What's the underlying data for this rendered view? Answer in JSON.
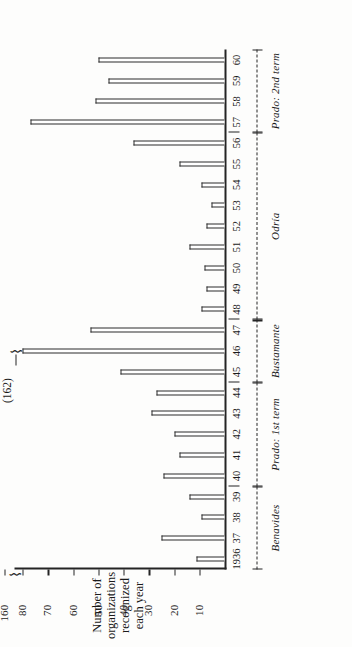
{
  "figure": {
    "orientation": "rotated-90-ccw",
    "y_axis_title": "Number of\norganizations\nrecognized\neach year",
    "out_of_range_note": "(162)",
    "axis_break_glyph": "⌇"
  },
  "chart_data": {
    "type": "bar",
    "title": "",
    "subtitle": "",
    "xlabel": "",
    "ylabel": "Number of organizations recognized each year",
    "ylim": [
      0,
      80
    ],
    "y_break_above": 80,
    "ytick_labels": [
      "10",
      "20",
      "30",
      "40",
      "50",
      "60",
      "70",
      "80",
      "160"
    ],
    "ytick_values": [
      10,
      20,
      30,
      40,
      50,
      60,
      70,
      80,
      160
    ],
    "grid": false,
    "legend": "none",
    "categories": [
      "1936",
      "37",
      "38",
      "39",
      "40",
      "41",
      "42",
      "43",
      "44",
      "45",
      "46",
      "47",
      "48",
      "49",
      "50",
      "51",
      "52",
      "53",
      "54",
      "55",
      "56",
      "57",
      "58",
      "59",
      "60"
    ],
    "values": [
      11,
      25,
      9,
      14,
      24,
      18,
      20,
      29,
      27,
      41,
      162,
      53,
      9,
      7,
      8,
      14,
      7,
      5,
      9,
      18,
      36,
      77,
      51,
      46,
      50
    ],
    "annotations": [
      {
        "label": "(162)",
        "category": "46",
        "note": "value exceeds broken axis"
      }
    ],
    "period_bands": [
      {
        "label": "Benavides",
        "start_category": "1936",
        "end_category": "39"
      },
      {
        "label": "Prado: 1st term",
        "start_category": "40",
        "end_category": "44"
      },
      {
        "label": "Bustamante",
        "start_category": "45",
        "end_category": "47"
      },
      {
        "label": "Odría",
        "start_category": "48",
        "end_category": "56"
      },
      {
        "label": "Prado: 2nd term",
        "start_category": "57",
        "end_category": "60"
      }
    ]
  }
}
